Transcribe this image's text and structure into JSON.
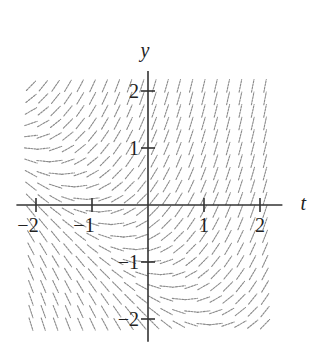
{
  "figure": {
    "type": "slope-field",
    "x_axis": {
      "label": "t",
      "ticks": [
        {
          "value": -2,
          "label": "−2"
        },
        {
          "value": -1,
          "label": "−1"
        },
        {
          "value": 1,
          "label": "1"
        },
        {
          "value": 2,
          "label": "2"
        }
      ]
    },
    "y_axis": {
      "label": "y",
      "ticks": [
        {
          "value": 2,
          "label": "2"
        },
        {
          "value": 1,
          "label": "1"
        },
        {
          "value": -1,
          "label": "−1"
        },
        {
          "value": -2,
          "label": "−2"
        }
      ]
    },
    "field": {
      "t_range": [
        -2.2,
        2.2
      ],
      "y_range": [
        -2.2,
        2.2
      ],
      "columns": 20,
      "rows": 20,
      "approx_equation": "dy/dt ≈ t + y + 1",
      "segment_color": "#8a8a8a",
      "axis_color": "#333333"
    }
  },
  "layout": {
    "origin_px": [
      148,
      205
    ],
    "px_per_unit_t": 56,
    "px_per_unit_y": 57
  }
}
